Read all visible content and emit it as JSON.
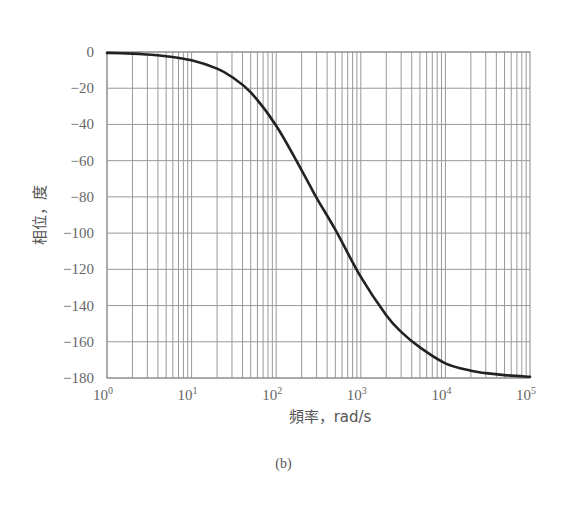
{
  "chart_data": {
    "type": "line",
    "title": "",
    "caption": "(b)",
    "xlabel": "頻率，rad/s",
    "ylabel": "相位，度",
    "xscale": "log",
    "xlim": [
      1,
      100000
    ],
    "ylim": [
      -180,
      0
    ],
    "grid": true,
    "x_tick_labels": [
      {
        "base": "10",
        "exp": "0"
      },
      {
        "base": "10",
        "exp": "1"
      },
      {
        "base": "10",
        "exp": "2"
      },
      {
        "base": "10",
        "exp": "3"
      },
      {
        "base": "10",
        "exp": "4"
      },
      {
        "base": "10",
        "exp": "5"
      }
    ],
    "y_ticks": [
      0,
      -20,
      -40,
      -60,
      -80,
      -100,
      -120,
      -140,
      -160,
      -180
    ],
    "y_tick_labels": [
      "0",
      "−20",
      "−40",
      "−60",
      "−80",
      "−100",
      "−120",
      "−140",
      "−160",
      "−180"
    ],
    "series": [
      {
        "name": "phase",
        "color": "#222222",
        "x": [
          1,
          2,
          3,
          5,
          10,
          20,
          30,
          50,
          100,
          200,
          300,
          500,
          1000,
          2000,
          3000,
          5000,
          10000,
          20000,
          30000,
          50000,
          100000
        ],
        "values": [
          -0.5,
          -0.9,
          -1.4,
          -2.3,
          -4.6,
          -9.2,
          -13.8,
          -22.3,
          -40.7,
          -65.3,
          -80.5,
          -98.1,
          -124.2,
          -145.3,
          -154.5,
          -163.1,
          -171.9,
          -176.0,
          -177.3,
          -178.4,
          -179.3
        ]
      }
    ]
  }
}
